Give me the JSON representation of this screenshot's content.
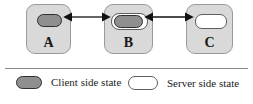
{
  "figure": {
    "type": "node-state-diagram",
    "nodes": [
      {
        "id": "A",
        "label": "A",
        "states": [
          "client side state"
        ]
      },
      {
        "id": "B",
        "label": "B",
        "states": [
          "server side state",
          "client side state"
        ]
      },
      {
        "id": "C",
        "label": "C",
        "states": [
          "server side state"
        ]
      }
    ],
    "connections": [
      {
        "from": "A",
        "to": "B",
        "direction": "bidirectional"
      },
      {
        "from": "B",
        "to": "C",
        "direction": "bidirectional"
      }
    ]
  },
  "legend": {
    "items": [
      {
        "key": "client",
        "label": "Client side state",
        "swatch": "filled-gray-capsule",
        "color": "#8f8f8f"
      },
      {
        "key": "server",
        "label": "Server side state",
        "swatch": "white-capsule",
        "color": "#ffffff"
      }
    ]
  }
}
